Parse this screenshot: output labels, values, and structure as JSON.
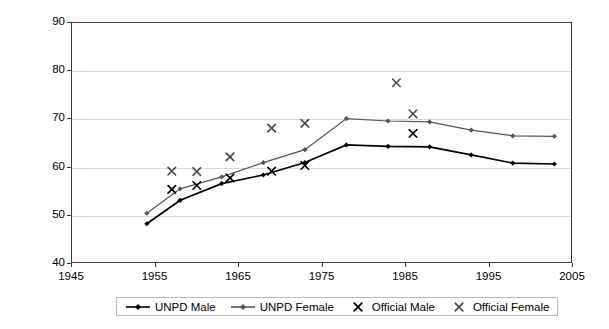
{
  "chart_data": {
    "type": "line",
    "title": "",
    "subtitle": "",
    "xlabel": "",
    "ylabel": "",
    "xlim": [
      1945,
      2005
    ],
    "ylim": [
      40,
      90
    ],
    "xticks": [
      1945,
      1955,
      1965,
      1975,
      1985,
      1995,
      2005
    ],
    "yticks": [
      40,
      50,
      60,
      70,
      80,
      90
    ],
    "grid": true,
    "legend_position": "bottom",
    "series": [
      {
        "name": "UNPD Male",
        "marker": "diamond",
        "style": "line-marker",
        "color": "#000000",
        "points": [
          [
            1954,
            48.0
          ],
          [
            1958,
            52.9
          ],
          [
            1963,
            56.4
          ],
          [
            1968,
            58.2
          ],
          [
            1973,
            60.8
          ],
          [
            1978,
            64.5
          ],
          [
            1983,
            64.2
          ],
          [
            1988,
            64.1
          ],
          [
            1993,
            62.4
          ],
          [
            1998,
            60.7
          ],
          [
            2003,
            60.5
          ]
        ]
      },
      {
        "name": "UNPD Female",
        "marker": "diamond",
        "style": "line-marker",
        "color": "#555555",
        "points": [
          [
            1954,
            50.2
          ],
          [
            1958,
            55.3
          ],
          [
            1963,
            57.8
          ],
          [
            1968,
            60.8
          ],
          [
            1973,
            63.5
          ],
          [
            1978,
            70.0
          ],
          [
            1983,
            69.5
          ],
          [
            1988,
            69.3
          ],
          [
            1993,
            67.6
          ],
          [
            1998,
            66.4
          ],
          [
            2003,
            66.3
          ]
        ]
      },
      {
        "name": "Official Male",
        "marker": "x",
        "style": "markers-only",
        "color": "#000000",
        "points": [
          [
            1957,
            55.2
          ],
          [
            1960,
            56.0
          ],
          [
            1964,
            57.6
          ],
          [
            1969,
            59.0
          ],
          [
            1973,
            60.2
          ],
          [
            1986,
            66.9
          ]
        ]
      },
      {
        "name": "Official Female",
        "marker": "x",
        "style": "markers-only",
        "color": "#4a4a4a",
        "points": [
          [
            1957,
            59.0
          ],
          [
            1960,
            58.9
          ],
          [
            1964,
            62.0
          ],
          [
            1969,
            68.0
          ],
          [
            1973,
            69.0
          ],
          [
            1984,
            77.5
          ],
          [
            1986,
            71.0
          ]
        ]
      }
    ]
  },
  "legend": {
    "items": [
      {
        "label": "UNPD Male",
        "marker": "line-diamond",
        "color": "#000000"
      },
      {
        "label": "UNPD Female",
        "marker": "line-diamond",
        "color": "#555555"
      },
      {
        "label": "Official Male",
        "marker": "x",
        "color": "#000000"
      },
      {
        "label": "Official Female",
        "marker": "x",
        "color": "#4a4a4a"
      }
    ]
  }
}
